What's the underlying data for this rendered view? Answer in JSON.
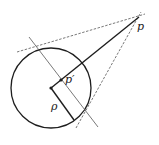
{
  "diagram": {
    "type": "inversion-in-circle",
    "colors": {
      "stroke": "#1e1e1e",
      "dashed": "#555555",
      "background": "#ffffff"
    },
    "circle": {
      "cx": 51,
      "cy": 88,
      "r": 40
    },
    "points": {
      "center": {
        "x": 51,
        "y": 88
      },
      "p": {
        "x": 136,
        "y": 19,
        "label": "p"
      },
      "p_prime": {
        "x": 61,
        "y": 80,
        "label": "p′"
      },
      "radius_end": {
        "x": 73,
        "y": 119
      }
    },
    "labels": {
      "p": "p",
      "p_prime": "p′",
      "rho": "ρ"
    }
  }
}
